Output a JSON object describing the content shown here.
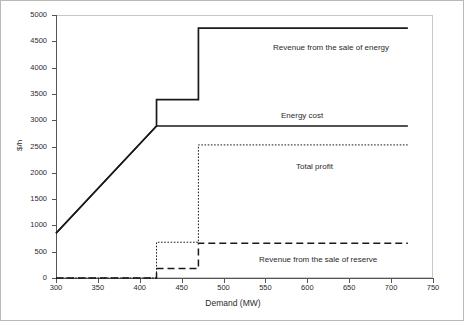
{
  "chart_data": {
    "type": "line",
    "title": "",
    "xlabel": "Demand (MW)",
    "ylabel": "$/h",
    "xlim": [
      300,
      750
    ],
    "ylim": [
      0,
      5000
    ],
    "xticks": [
      300,
      350,
      400,
      450,
      500,
      550,
      600,
      650,
      700,
      750
    ],
    "yticks": [
      0,
      500,
      1000,
      1500,
      2000,
      2500,
      3000,
      3500,
      4000,
      4500,
      5000
    ],
    "grid": false,
    "legend_position": "inline-annotations",
    "series": [
      {
        "name": "Revenue from the sale of energy",
        "style": "solid",
        "color": "#1a1a1a",
        "points": [
          [
            300,
            850
          ],
          [
            420,
            2890
          ],
          [
            420,
            3390
          ],
          [
            470,
            3390
          ],
          [
            470,
            4750
          ],
          [
            720,
            4750
          ]
        ]
      },
      {
        "name": "Energy cost",
        "style": "solid",
        "color": "#1a1a1a",
        "points": [
          [
            300,
            850
          ],
          [
            420,
            2890
          ],
          [
            720,
            2890
          ]
        ]
      },
      {
        "name": "Total profit",
        "style": "dotted",
        "color": "#1a1a1a",
        "points": [
          [
            300,
            0
          ],
          [
            420,
            0
          ],
          [
            420,
            680
          ],
          [
            470,
            680
          ],
          [
            470,
            2530
          ],
          [
            720,
            2530
          ]
        ]
      },
      {
        "name": "Revenue from the sale of reserve",
        "style": "dashed",
        "color": "#1a1a1a",
        "points": [
          [
            300,
            0
          ],
          [
            420,
            0
          ],
          [
            420,
            180
          ],
          [
            470,
            180
          ],
          [
            470,
            660
          ],
          [
            720,
            660
          ]
        ]
      }
    ],
    "annotations": [
      {
        "text": "Revenue from the sale of energy",
        "x": 540,
        "y": 4350
      },
      {
        "text": "Energy cost",
        "x": 560,
        "y": 3090
      },
      {
        "text": "Total profit",
        "x": 580,
        "y": 2130
      },
      {
        "text": "Revenue from the sale of reserve",
        "x": 530,
        "y": 390
      }
    ]
  },
  "axes": {
    "x_title": "Demand (MW)",
    "y_title": "$/h",
    "x_tick_labels": [
      "300",
      "350",
      "400",
      "450",
      "500",
      "550",
      "600",
      "650",
      "700",
      "750"
    ],
    "y_tick_labels": [
      "0",
      "500",
      "1000",
      "1500",
      "2000",
      "2500",
      "3000",
      "3500",
      "4000",
      "4500",
      "5000"
    ]
  },
  "annotations": {
    "energy_revenue": "Revenue from the sale of energy",
    "energy_cost": "Energy cost",
    "total_profit": "Total profit",
    "reserve_revenue": "Revenue from the sale of reserve"
  },
  "colors": {
    "series_line": "#1a1a1a",
    "axis": "#555555",
    "frame": "#c8c8c8",
    "border": "#b9b9b9",
    "text": "#2b2b2b",
    "background": "#ffffff"
  }
}
